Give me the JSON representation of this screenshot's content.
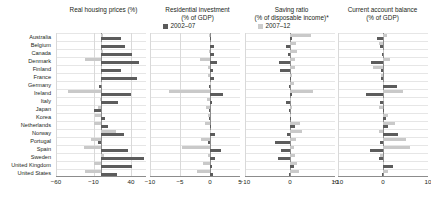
{
  "legend": [
    {
      "label": "2002–07",
      "color": "#5c5c5c",
      "swatch": "dark"
    },
    {
      "label": "2007–12",
      "color": "#c9c9c9",
      "swatch": "light"
    }
  ],
  "countries": [
    "Australia",
    "Belgium",
    "Canada",
    "Denmark",
    "Finland",
    "France",
    "Germany",
    "Ireland",
    "Italy",
    "Japan",
    "Korea",
    "Netherlands",
    "Norway",
    "Portugal",
    "Spain",
    "Sweden",
    "United Kingdom",
    "United States"
  ],
  "chart_data": [
    {
      "type": "bar",
      "title": "Real housing prices (%)",
      "title_lines": [
        "Real housing prices (%)"
      ],
      "xlabel": "",
      "ylabel": "",
      "xlim": [
        -60,
        60
      ],
      "ticks": [
        -60,
        -10,
        40
      ],
      "ticklabels": [
        "−60",
        "−10",
        "40"
      ],
      "grid": true,
      "orientation": "horizontal",
      "categories": [
        "Australia",
        "Belgium",
        "Canada",
        "Denmark",
        "Finland",
        "France",
        "Germany",
        "Ireland",
        "Italy",
        "Japan",
        "Korea",
        "Netherlands",
        "Norway",
        "Portugal",
        "Spain",
        "Sweden",
        "United Kingdom",
        "United States"
      ],
      "series": [
        {
          "name": "2002–07",
          "color": "#5c5c5c",
          "values": [
            26,
            32,
            41,
            50,
            27,
            48,
            -3,
            40,
            22,
            -9,
            5,
            9,
            31,
            -4,
            36,
            57,
            41,
            21
          ]
        },
        {
          "name": "2007–12",
          "color": "#c9c9c9",
          "values": [
            2,
            0,
            2,
            -22,
            0,
            1,
            1,
            -44,
            -2,
            -4,
            -8,
            -9,
            20,
            -13,
            -23,
            4,
            -9,
            -21
          ]
        }
      ]
    },
    {
      "type": "bar",
      "title": "Residential investment (% of GDP)",
      "title_lines": [
        "Residential investment",
        "(% of GDP)"
      ],
      "xlabel": "",
      "ylabel": "",
      "xlim": [
        -10,
        5
      ],
      "ticks": [
        -10,
        -5,
        0,
        5
      ],
      "ticklabels": [
        "−10",
        "−5",
        "0",
        "5"
      ],
      "grid": true,
      "orientation": "horizontal",
      "categories": [
        "Australia",
        "Belgium",
        "Canada",
        "Denmark",
        "Finland",
        "France",
        "Germany",
        "Ireland",
        "Italy",
        "Japan",
        "Korea",
        "Netherlands",
        "Norway",
        "Portugal",
        "Spain",
        "Sweden",
        "United Kingdom",
        "United States"
      ],
      "series": [
        {
          "name": "2002–07",
          "color": "#5c5c5c",
          "values": [
            0.2,
            0.7,
            0.6,
            1.2,
            0.5,
            0.6,
            -0.2,
            2.1,
            0.4,
            -0.1,
            -0.2,
            0.2,
            0.8,
            -0.3,
            1.8,
            0.9,
            0.4,
            0.5
          ]
        },
        {
          "name": "2007–12",
          "color": "#c9c9c9",
          "values": [
            -0.1,
            0.1,
            -0.1,
            -1.6,
            -0.3,
            -0.4,
            0.1,
            -6.8,
            -0.5,
            -0.6,
            -0.4,
            -0.9,
            0.2,
            -1.5,
            -4.6,
            -0.3,
            -1.1,
            -2.1
          ]
        }
      ]
    },
    {
      "type": "bar",
      "title": "Saving ratio (% of disposable income)*",
      "title_lines": [
        "Saving ratio",
        "(% of disposable income)*"
      ],
      "xlabel": "",
      "ylabel": "",
      "xlim": [
        -10,
        10
      ],
      "ticks": [
        -10,
        0,
        10
      ],
      "ticklabels": [
        "−10",
        "0",
        "10"
      ],
      "grid": true,
      "orientation": "horizontal",
      "categories": [
        "Australia",
        "Belgium",
        "Canada",
        "Denmark",
        "Finland",
        "France",
        "Germany",
        "Ireland",
        "Italy",
        "Japan",
        "Korea",
        "Netherlands",
        "Norway",
        "Portugal",
        "Spain",
        "Sweden",
        "United Kingdom",
        "United States"
      ],
      "series": [
        {
          "name": "2002–07",
          "color": "#5c5c5c",
          "values": [
            0.4,
            -0.8,
            -0.5,
            -2.4,
            -2.2,
            0.1,
            -0.2,
            0.4,
            -0.9,
            -0.3,
            0.1,
            1.1,
            -0.6,
            -3.4,
            -1.9,
            -2.6,
            0.9,
            -0.2
          ]
        },
        {
          "name": "2007–12",
          "color": "#c9c9c9",
          "values": [
            4.7,
            1.4,
            1.6,
            1.0,
            1.0,
            0.4,
            0.9,
            5.1,
            0.2,
            0.5,
            0.3,
            2.2,
            2.6,
            1.3,
            0.9,
            1.2,
            1.5,
            2.0
          ]
        }
      ]
    },
    {
      "type": "bar",
      "title": "Current account balance (% of GDP)",
      "title_lines": [
        "Current account balance",
        "(% of GDP)"
      ],
      "xlabel": "",
      "ylabel": "",
      "xlim": [
        -10,
        10
      ],
      "ticks": [
        -10,
        0,
        10
      ],
      "ticklabels": [
        "−10",
        "0",
        "10"
      ],
      "grid": true,
      "orientation": "horizontal",
      "categories": [
        "Australia",
        "Belgium",
        "Canada",
        "Denmark",
        "Finland",
        "France",
        "Germany",
        "Ireland",
        "Italy",
        "Japan",
        "Korea",
        "Netherlands",
        "Norway",
        "Portugal",
        "Spain",
        "Sweden",
        "United Kingdom",
        "United States"
      ],
      "series": [
        {
          "name": "2002–07",
          "color": "#5c5c5c",
          "values": [
            -1.3,
            -0.6,
            -0.3,
            -2.6,
            -0.5,
            -0.4,
            3.0,
            -3.7,
            -0.7,
            0.2,
            0.6,
            1.2,
            3.4,
            -0.7,
            -2.9,
            -1.0,
            2.2,
            -0.2
          ]
        },
        {
          "name": "2007–12",
          "color": "#c9c9c9",
          "values": [
            0.9,
            -0.9,
            0.1,
            1.6,
            -2.3,
            -0.4,
            0.1,
            4.4,
            0.3,
            -0.9,
            1.2,
            2.6,
            -0.8,
            5.2,
            6.1,
            -0.6,
            0.2,
            1.0
          ]
        }
      ]
    }
  ]
}
